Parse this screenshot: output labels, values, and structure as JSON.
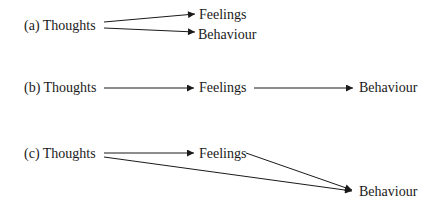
{
  "diagrams": [
    {
      "id": "a",
      "label": "(a) Thoughts",
      "nodes": {
        "feelings": "Feelings",
        "behaviour": "Behaviour"
      },
      "edges": [
        {
          "from": "Thoughts",
          "to": "Feelings"
        },
        {
          "from": "Thoughts",
          "to": "Behaviour"
        }
      ]
    },
    {
      "id": "b",
      "label": "(b) Thoughts",
      "nodes": {
        "feelings": "Feelings",
        "behaviour": "Behaviour"
      },
      "edges": [
        {
          "from": "Thoughts",
          "to": "Feelings"
        },
        {
          "from": "Feelings",
          "to": "Behaviour"
        }
      ]
    },
    {
      "id": "c",
      "label": "(c) Thoughts",
      "nodes": {
        "feelings": "Feelings",
        "behaviour": "Behaviour"
      },
      "edges": [
        {
          "from": "Thoughts",
          "to": "Feelings"
        },
        {
          "from": "Thoughts",
          "to": "Behaviour"
        },
        {
          "from": "Feelings",
          "to": "Behaviour"
        }
      ]
    }
  ]
}
